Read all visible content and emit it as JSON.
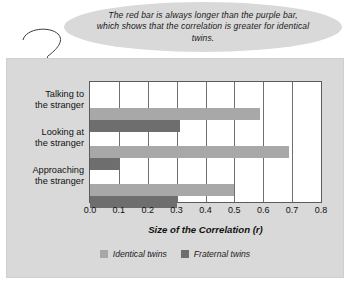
{
  "callout": {
    "text": "The red bar is always longer than the purple bar, which shows that the correlation is greater for identical twins.",
    "leader_icon": "callout-leader-line"
  },
  "chart_data": {
    "type": "bar",
    "orientation": "horizontal",
    "title": "",
    "xlabel": "Size of the Correlation (r)",
    "ylabel": "",
    "xlim": [
      0.0,
      0.8
    ],
    "grid": true,
    "legend_position": "bottom",
    "categories": [
      "Talking to the stranger",
      "Looking at the stranger",
      "Approaching the stranger"
    ],
    "categories_lines": [
      [
        "Talking to",
        "the stranger"
      ],
      [
        "Looking at",
        "the stranger"
      ],
      [
        "Approaching",
        "the stranger"
      ]
    ],
    "tick_labels": [
      "0.0",
      "0.1",
      "0.2",
      "0.3",
      "0.4",
      "0.5",
      "0.6",
      "0.7",
      "0.8"
    ],
    "tick_values": [
      0.0,
      0.1,
      0.2,
      0.3,
      0.4,
      0.5,
      0.6,
      0.7,
      0.8
    ],
    "series": [
      {
        "name": "Identical twins",
        "color": "#a8a8a8",
        "values": [
          0.59,
          0.69,
          0.5
        ]
      },
      {
        "name": "Fraternal twins",
        "color": "#6e6e6e",
        "values": [
          0.31,
          0.1,
          0.3
        ]
      }
    ]
  },
  "colors": {
    "panel_background": "#d9d9d9",
    "plot_background": "#ffffff",
    "axis": "#5b5b5b",
    "grid": "#6f6f6f",
    "identical": "#a8a8a8",
    "fraternal": "#6e6e6e"
  }
}
